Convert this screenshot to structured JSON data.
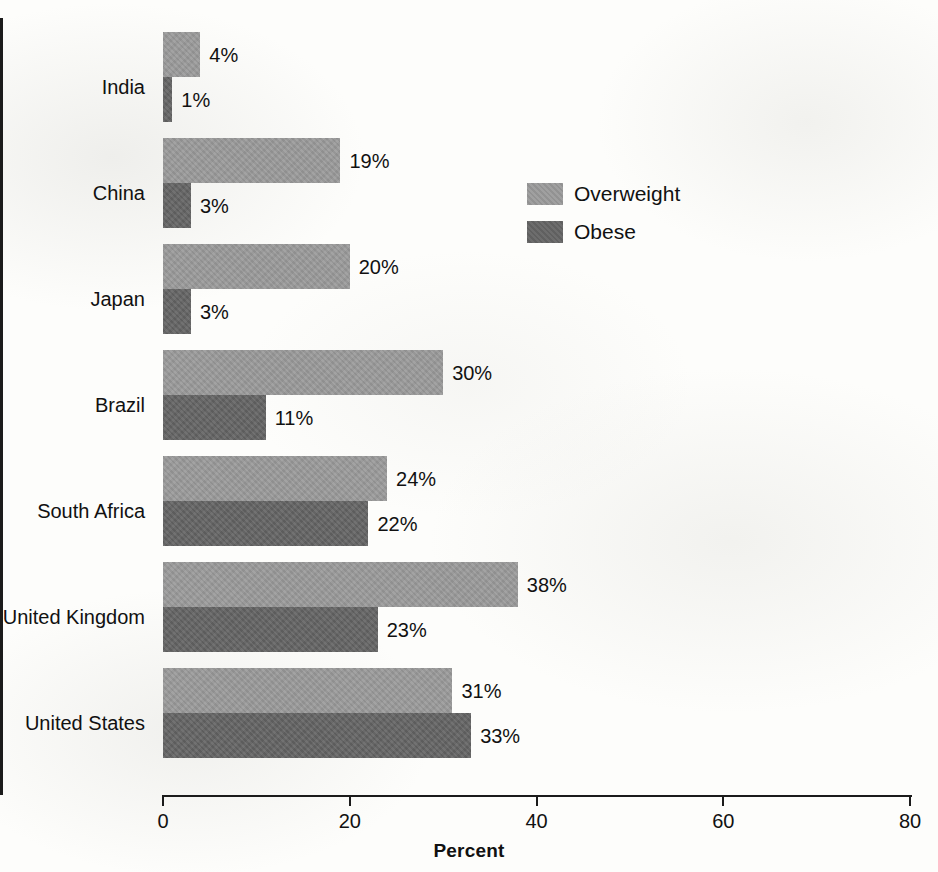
{
  "chart_data": {
    "type": "bar",
    "orientation": "horizontal",
    "title": "",
    "xlabel": "Percent",
    "ylabel": "",
    "xlim": [
      0,
      80
    ],
    "xticks": [
      0,
      20,
      40,
      60,
      80
    ],
    "xtick_labels": [
      "0",
      "20",
      "40",
      "60",
      "80"
    ],
    "grid": false,
    "legend_position": "upper right inside plot",
    "categories": [
      "India",
      "China",
      "Japan",
      "Brazil",
      "South Africa",
      "United Kingdom",
      "United States"
    ],
    "series": [
      {
        "name": "Overweight",
        "color": "#9a9a9a",
        "values": [
          4,
          19,
          20,
          30,
          24,
          38,
          31
        ],
        "value_labels": [
          "4%",
          "19%",
          "20%",
          "30%",
          "24%",
          "38%",
          "31%"
        ]
      },
      {
        "name": "Obese",
        "color": "#656565",
        "values": [
          1,
          3,
          3,
          11,
          22,
          23,
          33
        ],
        "value_labels": [
          "1%",
          "3%",
          "3%",
          "11%",
          "22%",
          "23%",
          "33%"
        ]
      }
    ]
  },
  "legend": {
    "items": [
      {
        "label": "Overweight",
        "color": "#9a9a9a"
      },
      {
        "label": "Obese",
        "color": "#656565"
      }
    ]
  },
  "axis": {
    "x_title": "Percent",
    "tick_labels": [
      "0",
      "20",
      "40",
      "60",
      "80"
    ]
  },
  "colors": {
    "overweight": "#9a9a9a",
    "obese": "#656565",
    "axis": "#1b1b1b",
    "text": "#111111",
    "background": "#fdfdfb"
  }
}
